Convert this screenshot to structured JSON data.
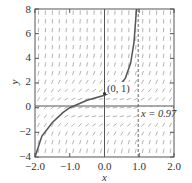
{
  "chart_data": {
    "type": "line",
    "title": "",
    "xlabel": "x",
    "ylabel": "y",
    "xlim": [
      -2.0,
      2.0
    ],
    "ylim": [
      -4,
      8
    ],
    "xticks": [
      "-2.0",
      "-1.0",
      "0.0",
      "1.0",
      "2.0"
    ],
    "yticks": [
      "-4",
      "-2",
      "0",
      "2",
      "4",
      "6",
      "8"
    ],
    "grid": false,
    "background": "slope field (short line segments)",
    "series": [
      {
        "name": "solution curve through (0, 1)",
        "x": [
          -2.0,
          -1.8,
          -1.5,
          -1.2,
          -1.0,
          -0.5,
          0.0,
          0.4,
          0.6,
          0.75,
          0.85,
          0.92
        ],
        "y": [
          -4.0,
          -2.3,
          -1.2,
          -0.4,
          0.0,
          0.6,
          1.0,
          1.6,
          2.4,
          3.6,
          5.3,
          8.0
        ]
      }
    ],
    "annotations": [
      {
        "text": "(0, 1)",
        "x": 0.0,
        "y": 1.0,
        "type": "point-label"
      },
      {
        "text": "x = 0.97",
        "x": 0.97,
        "type": "vertical-dashed-asymptote"
      }
    ],
    "colors": {
      "curve": "#555555",
      "axes": "#555555",
      "field": "#999999",
      "text": "#333333"
    }
  },
  "labels": {
    "xlabel": "x",
    "ylabel": "y",
    "point": "(0, 1)",
    "asymptote": "x = 0.97",
    "xticks": [
      "−2.0",
      "−1.0",
      "0.0",
      "1.0",
      "2.0"
    ],
    "yticks": [
      "8",
      "6",
      "4",
      "2",
      "0",
      "−2",
      "−4"
    ]
  }
}
